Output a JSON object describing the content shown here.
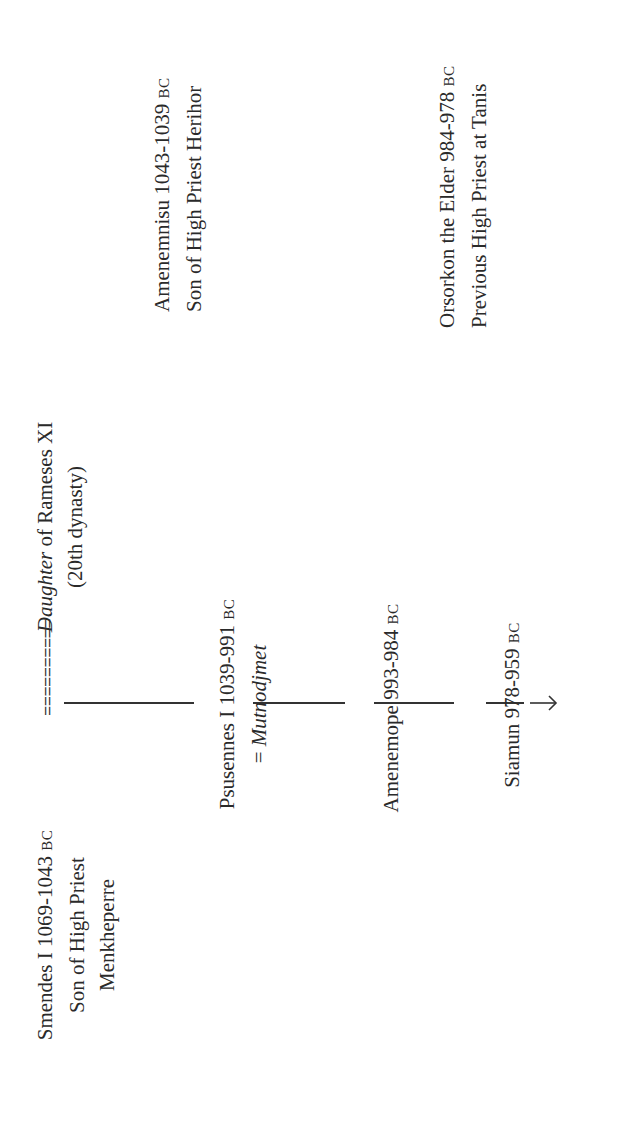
{
  "diagram": {
    "orientation": "rotated -90deg (text reads bottom-to-top)",
    "colors": {
      "text": "#2a2a2a",
      "line": "#333333",
      "background": "#ffffff"
    },
    "marriage_connector": "==========",
    "founder": {
      "name_line": "Smendes I 1069-1043",
      "era": "BC",
      "line2": "Son of High Priest",
      "line3": "Menkheperre"
    },
    "spouse": {
      "name_italic": "Daughter",
      "name_rest": " of Rameses XI",
      "line2": "(20th dynasty)"
    },
    "collateral": [
      {
        "name_line": "Amenemnisu 1043-1039",
        "era": "BC",
        "line2": "Son of High Priest Herihor"
      },
      {
        "name_line": "Orsorkon the Elder 984-978",
        "era": "BC",
        "line2": "Previous High Priest at Tanis"
      }
    ],
    "succession": [
      {
        "name_line": "Psusennes I 1039-991",
        "era": "BC",
        "consort_prefix": "= ",
        "consort": "Mutnodjmet"
      },
      {
        "name_line": "Amenemope 993-984",
        "era": "BC"
      },
      {
        "name_line": "Siamun 978-959",
        "era": "BC"
      }
    ],
    "continuation_icon": "right-arrow-icon"
  }
}
